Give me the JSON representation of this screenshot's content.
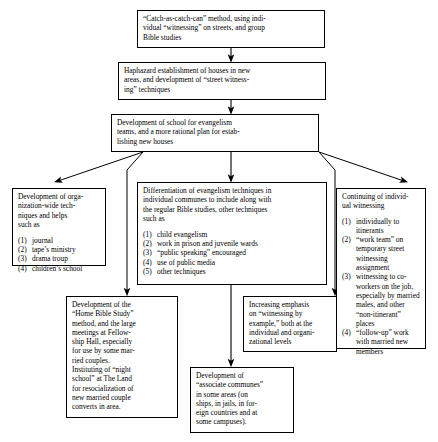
{
  "diagram": {
    "background_color": "#ffffff",
    "line_color": "#000000",
    "text_color": "#000000"
  },
  "nodes": {
    "catch_as_catch_can": {
      "lines": [
        "“Catch-as-catch-can” method, using indi-",
        "vidual “witnessing” on streets, and group",
        "Bible studies"
      ]
    },
    "haphazard": {
      "lines": [
        "Haphazard establishment of houses in new",
        "areas, and development of “street witness-",
        "ing” techniques"
      ]
    },
    "school": {
      "lines": [
        "Development of school for evangelism",
        "teams, and a more rational plan for estab-",
        "lishing new houses"
      ]
    },
    "org_wide": {
      "lines": [
        "Development of orga-",
        "nization-wide tech-",
        "niques and helps",
        "such as"
      ],
      "list": [
        {
          "num": "(1)",
          "text": "journal"
        },
        {
          "num": "(2)",
          "text": "tape’s ministry"
        },
        {
          "num": "(3)",
          "text": "drama troup"
        },
        {
          "num": "(4)",
          "text": "children’s school"
        }
      ]
    },
    "differentiation": {
      "lines": [
        "Differentiation of evangelism techniques in",
        "individual communes to include along with",
        "the regular Bible studies, other techniques",
        "such as"
      ],
      "list": [
        {
          "num": "(1)",
          "text": "child evangelism"
        },
        {
          "num": "(2)",
          "text": "work in prison and juvenile wards"
        },
        {
          "num": "(3)",
          "text": "“public speaking” encouraged"
        },
        {
          "num": "(4)",
          "text": "use of public media"
        },
        {
          "num": "(5)",
          "text": "other techniques"
        }
      ]
    },
    "continuing": {
      "lines": [
        "Continuing of individ-",
        "ual witnessing"
      ],
      "list": [
        {
          "num": "(1)",
          "text": "individually to itinerants"
        },
        {
          "num": "(2)",
          "text": "“work team” on temporary street witnessing assignment"
        },
        {
          "num": "(3)",
          "text": "witnessing to co-workers on the job, especially by married males, and other “non-itinerant” places"
        },
        {
          "num": "(4)",
          "text": "“follow-up” work with married new members"
        }
      ]
    },
    "home_bible_study": {
      "lines": [
        "Development of the",
        "“Home Bible Study”",
        "method, and the large",
        "meetings at Fellow-",
        "ship Hall, especially",
        "for use by some mar-",
        "ried couples.",
        "Instituting of “night",
        "school” at The Land",
        "for resocialization of",
        "new married couple",
        "converts in area."
      ]
    },
    "increasing_emphasis": {
      "lines": [
        "Increasing emphasis",
        "on “witnessing by",
        "example,” both at the",
        "individual and organi-",
        "zational levels"
      ]
    },
    "associate_communes": {
      "lines": [
        "Development of",
        "“associate communes”",
        "in some areas (on",
        "ships, in jails, in for-",
        "eign countries and at",
        "some campuses)."
      ]
    }
  }
}
